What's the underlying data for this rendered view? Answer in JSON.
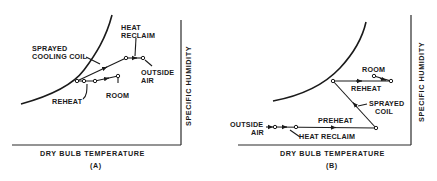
{
  "figure": {
    "panels": [
      {
        "id": "A",
        "caption": "(A)",
        "x_axis_label": "DRY BULB TEMPERATURE",
        "y_axis_label": "SPECIFIC HUMIDITY",
        "labels": {
          "heat": "HEAT",
          "reclaim": "RECLAIM",
          "sprayed": "SPRAYED",
          "cooling_coil": "COOLING COIL",
          "outside": "OUTSIDE",
          "air": "AIR",
          "reheat": "REHEAT",
          "room": "ROOM"
        }
      },
      {
        "id": "B",
        "caption": "(B)",
        "x_axis_label": "DRY BULB TEMPERATURE",
        "y_axis_label": "SPECIFIC HUMIDITY",
        "labels": {
          "room": "ROOM",
          "reheat": "REHEAT",
          "sprayed": "SPRAYED",
          "coil": "COIL",
          "preheat": "PREHEAT",
          "outside": "OUTSIDE",
          "air": "AIR",
          "heat_reclaim": "HEAT RECLAIM"
        }
      }
    ],
    "colors": {
      "ink": "#1a1a1a",
      "background": "#ffffff"
    }
  }
}
